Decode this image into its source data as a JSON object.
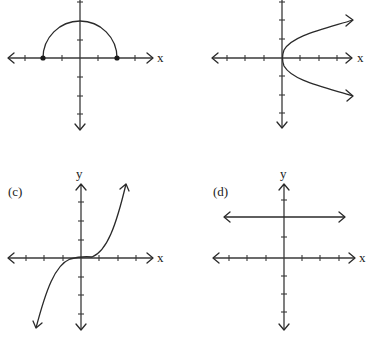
{
  "figure": {
    "panels": [
      {
        "id": "a",
        "label": "",
        "x_axis_label": "x",
        "y_axis_label": "",
        "graph": "upper semicircle with closed endpoints",
        "origin": [
          80,
          58
        ],
        "unit_px": 18.5,
        "x_range": [
          -4,
          4
        ],
        "y_range": [
          -4,
          3
        ],
        "curve": {
          "type": "semicircle",
          "radius_units": 2,
          "endpoints": [
            [
              -2,
              0
            ],
            [
              2,
              0
            ]
          ],
          "closed_endpoints": true
        }
      },
      {
        "id": "b",
        "label": "",
        "x_axis_label": "x",
        "y_axis_label": "",
        "graph": "sideways parabola x = y^2 opening right",
        "origin": [
          282,
          58
        ],
        "unit_px": 18.5,
        "x_range": [
          -4,
          4
        ],
        "y_range": [
          -4,
          3
        ],
        "curve": {
          "type": "parabola-right",
          "vertex": [
            0,
            0
          ],
          "arrow_ends": [
            [
              4,
              2
            ],
            [
              4,
              -2
            ]
          ]
        }
      },
      {
        "id": "c",
        "label": "(c)",
        "x_axis_label": "x",
        "y_axis_label": "y",
        "graph": "cubic y = x^3",
        "origin": [
          81,
          258
        ],
        "unit_px": 18.5,
        "x_range": [
          -4,
          4
        ],
        "y_range": [
          -4,
          4
        ],
        "curve": {
          "type": "cubic",
          "through": [
            0,
            0
          ]
        }
      },
      {
        "id": "d",
        "label": "(d)",
        "x_axis_label": "x",
        "y_axis_label": "y",
        "graph": "horizontal line y = 2",
        "origin": [
          284,
          258
        ],
        "unit_px": 18.5,
        "x_range": [
          -4,
          4
        ],
        "y_range": [
          -4,
          4
        ],
        "curve": {
          "type": "horizontal-line",
          "y_value": 2
        }
      }
    ]
  },
  "colors": {
    "background": "#ffffff",
    "ink": "#2a2a2a"
  }
}
